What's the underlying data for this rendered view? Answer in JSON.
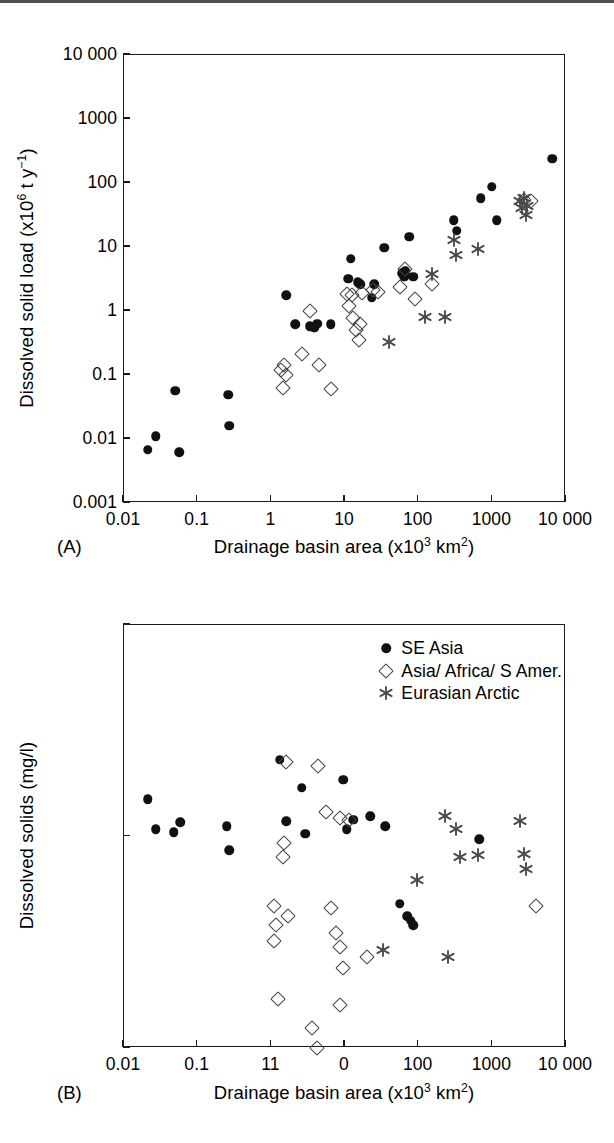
{
  "figure": {
    "series_styles": {
      "se_asia": "filled-circle",
      "asia_africa_samer": "open-diamond",
      "eurasian_arctic": "asterisk"
    },
    "colors": {
      "axis": "#1a1a1a",
      "circle": "#111111",
      "diamond": "#444444",
      "asterisk": "#4a4a4a",
      "background": "#ffffff"
    }
  },
  "legend": {
    "position": "top-right-panel-b",
    "items": [
      {
        "marker": "filled-circle",
        "label": "SE Asia"
      },
      {
        "marker": "open-diamond",
        "label": "Asia/ Africa/ S Amer."
      },
      {
        "marker": "asterisk",
        "label": "Eurasian Arctic"
      }
    ]
  },
  "panel_a": {
    "tag": "(A)",
    "chart_data": {
      "type": "scatter",
      "title": "",
      "xlabel": "Drainage basin area (x10^3 km^2)",
      "ylabel": "Dissolved solid load (x10^6 t y^-1)",
      "xscale": "log",
      "yscale": "log",
      "xlim": [
        0.01,
        10000
      ],
      "ylim": [
        0.001,
        10000
      ],
      "grid": false,
      "xticks": [
        0.01,
        0.1,
        1,
        10,
        100,
        1000,
        10000
      ],
      "xticklabels": [
        "0.01",
        "0.1",
        "1",
        "10",
        "100",
        "1000",
        "10 000"
      ],
      "yticks": [
        0.001,
        0.01,
        0.1,
        1,
        10,
        100,
        1000,
        10000
      ],
      "yticklabels": [
        "0.001",
        "0.01",
        "0.1",
        "1",
        "10",
        "100",
        "1000",
        "10 000"
      ],
      "series": [
        {
          "name": "SE Asia",
          "marker": "filled-circle",
          "points": [
            [
              0.021,
              0.0068
            ],
            [
              0.027,
              0.011
            ],
            [
              0.056,
              0.0062
            ],
            [
              0.05,
              0.057
            ],
            [
              0.26,
              0.049
            ],
            [
              0.27,
              0.016
            ],
            [
              1.6,
              1.75
            ],
            [
              2.1,
              0.62
            ],
            [
              3.3,
              0.58
            ],
            [
              3.8,
              0.55
            ],
            [
              4.2,
              0.63
            ],
            [
              6.4,
              0.62
            ],
            [
              11,
              3.2
            ],
            [
              12,
              6.5
            ],
            [
              15,
              2.8
            ],
            [
              16,
              2.6
            ],
            [
              23,
              1.6
            ],
            [
              25,
              2.6
            ],
            [
              34,
              9.7
            ],
            [
              60,
              3.9
            ],
            [
              64,
              3.4
            ],
            [
              66,
              4.2
            ],
            [
              75,
              14.5
            ],
            [
              85,
              3.4
            ],
            [
              300,
              26
            ],
            [
              330,
              18
            ],
            [
              700,
              58
            ],
            [
              980,
              88
            ],
            [
              1150,
              26
            ],
            [
              6500,
              240
            ]
          ]
        },
        {
          "name": "Asia/ Africa/ S Amer.",
          "marker": "open-diamond",
          "points": [
            [
              1.35,
              0.12
            ],
            [
              1.5,
              0.145
            ],
            [
              1.6,
              0.1
            ],
            [
              1.45,
              0.062
            ],
            [
              2.6,
              0.215
            ],
            [
              3.4,
              1.0
            ],
            [
              4.4,
              0.145
            ],
            [
              6.5,
              0.06
            ],
            [
              10.5,
              1.85
            ],
            [
              11.5,
              1.2
            ],
            [
              12.5,
              1.75
            ],
            [
              13,
              0.78
            ],
            [
              14,
              0.5
            ],
            [
              15.5,
              0.35
            ],
            [
              16,
              0.62
            ],
            [
              17,
              1.9
            ],
            [
              24,
              2.1
            ],
            [
              28,
              2.0
            ],
            [
              55,
              2.4
            ],
            [
              66,
              4.6
            ],
            [
              90,
              1.55
            ],
            [
              150,
              2.6
            ],
            [
              2700,
              55
            ],
            [
              3400,
              52
            ]
          ]
        },
        {
          "name": "Eurasian Arctic",
          "marker": "asterisk",
          "points": [
            [
              40,
              0.33
            ],
            [
              120,
              0.82
            ],
            [
              230,
              0.82
            ],
            [
              150,
              3.8
            ],
            [
              300,
              13
            ],
            [
              320,
              7.6
            ],
            [
              640,
              9.2
            ],
            [
              2400,
              52
            ],
            [
              2550,
              41
            ],
            [
              2700,
              58
            ],
            [
              2900,
              32
            ],
            [
              3000,
              44
            ]
          ]
        }
      ]
    }
  },
  "panel_b": {
    "tag": "(B)",
    "chart_data": {
      "type": "scatter",
      "title": "",
      "xlabel": "Drainage basin area (x10^3 km^2)",
      "ylabel": "Dissolved solids (mg/l)",
      "xscale": "log",
      "yscale": "log",
      "xlim": [
        0.01,
        10000
      ],
      "ylim": [
        10,
        1000
      ],
      "grid": false,
      "xticks": [
        0.01,
        0.1,
        1,
        10,
        100,
        1000,
        10000
      ],
      "xticklabels": [
        "0.01",
        "0.1",
        "11",
        "0",
        "100",
        "1000",
        "10 000"
      ],
      "xticklabels_note": "panel B tick labels reproduce a scan artifact: the '1' and '10' labels render as '11' and '0'",
      "yticks": [
        10,
        100,
        1000
      ],
      "yticklabels": [
        "10",
        "100",
        "1000"
      ],
      "series": [
        {
          "name": "SE Asia",
          "marker": "filled-circle",
          "points": [
            [
              0.021,
              150
            ],
            [
              0.027,
              108
            ],
            [
              0.047,
              105
            ],
            [
              0.058,
              117
            ],
            [
              0.25,
              112
            ],
            [
              0.27,
              86
            ],
            [
              1.3,
              230
            ],
            [
              1.6,
              118
            ],
            [
              2.6,
              170
            ],
            [
              2.9,
              103
            ],
            [
              9.5,
              185
            ],
            [
              10.5,
              108
            ],
            [
              13,
              120
            ],
            [
              22,
              125
            ],
            [
              35,
              112
            ],
            [
              55,
              48
            ],
            [
              70,
              42
            ],
            [
              78,
              40
            ],
            [
              85,
              38
            ],
            [
              660,
              97
            ]
          ]
        },
        {
          "name": "Asia/ Africa/ S Amer.",
          "marker": "open-diamond",
          "points": [
            [
              1.6,
              225
            ],
            [
              1.5,
              93
            ],
            [
              1.45,
              80
            ],
            [
              4.3,
              215
            ],
            [
              5.5,
              130
            ],
            [
              8.5,
              122
            ],
            [
              11.5,
              120
            ],
            [
              1.1,
              47
            ],
            [
              1.7,
              42
            ],
            [
              1.15,
              38
            ],
            [
              1.1,
              32
            ],
            [
              6.5,
              46
            ],
            [
              7.5,
              35
            ],
            [
              8.5,
              30
            ],
            [
              9.5,
              24
            ],
            [
              20,
              27
            ],
            [
              1.25,
              17
            ],
            [
              8.5,
              16
            ],
            [
              3.6,
              12.5
            ],
            [
              4.2,
              10
            ],
            [
              3900,
              47
            ]
          ]
        },
        {
          "name": "Eurasian Arctic",
          "marker": "asterisk",
          "points": [
            [
              230,
              125
            ],
            [
              320,
              108
            ],
            [
              360,
              80
            ],
            [
              640,
              82
            ],
            [
              95,
              62
            ],
            [
              2400,
              118
            ],
            [
              2700,
              83
            ],
            [
              2900,
              70
            ],
            [
              33,
              29
            ],
            [
              250,
              27
            ]
          ]
        }
      ]
    }
  }
}
